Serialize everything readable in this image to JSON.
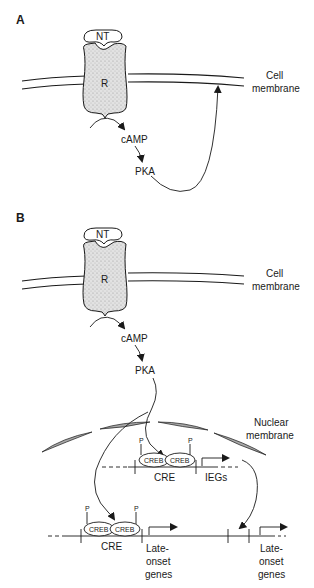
{
  "panels": [
    {
      "id": "A",
      "label": "A",
      "ligand": "NT",
      "receptor": "R",
      "membrane_label": [
        "Cell",
        "membrane"
      ],
      "second_messenger": "cAMP",
      "kinase": "PKA"
    },
    {
      "id": "B",
      "label": "B",
      "ligand": "NT",
      "receptor": "R",
      "membrane_label": [
        "Cell",
        "membrane"
      ],
      "second_messenger": "cAMP",
      "kinase": "PKA",
      "nuclear_membrane_label": [
        "Nuclear",
        "membrane"
      ],
      "upper_gene": {
        "phospho": [
          "P",
          "P"
        ],
        "factors": [
          "CREB",
          "CREB"
        ],
        "element": "CRE",
        "gene": "IEGs"
      },
      "lower_gene": {
        "phospho": [
          "P",
          "P"
        ],
        "factors": [
          "CREB",
          "CREB"
        ],
        "element": "CRE",
        "gene": [
          "Late-",
          "onset",
          "genes"
        ]
      },
      "lower_gene_2": {
        "gene": [
          "Late-",
          "onset",
          "genes"
        ]
      }
    }
  ],
  "colors": {
    "ink": "#1a1a1a",
    "receptor_fill": "#d9d9d9",
    "nuclear_membrane_fill": "#a8a8a8"
  }
}
